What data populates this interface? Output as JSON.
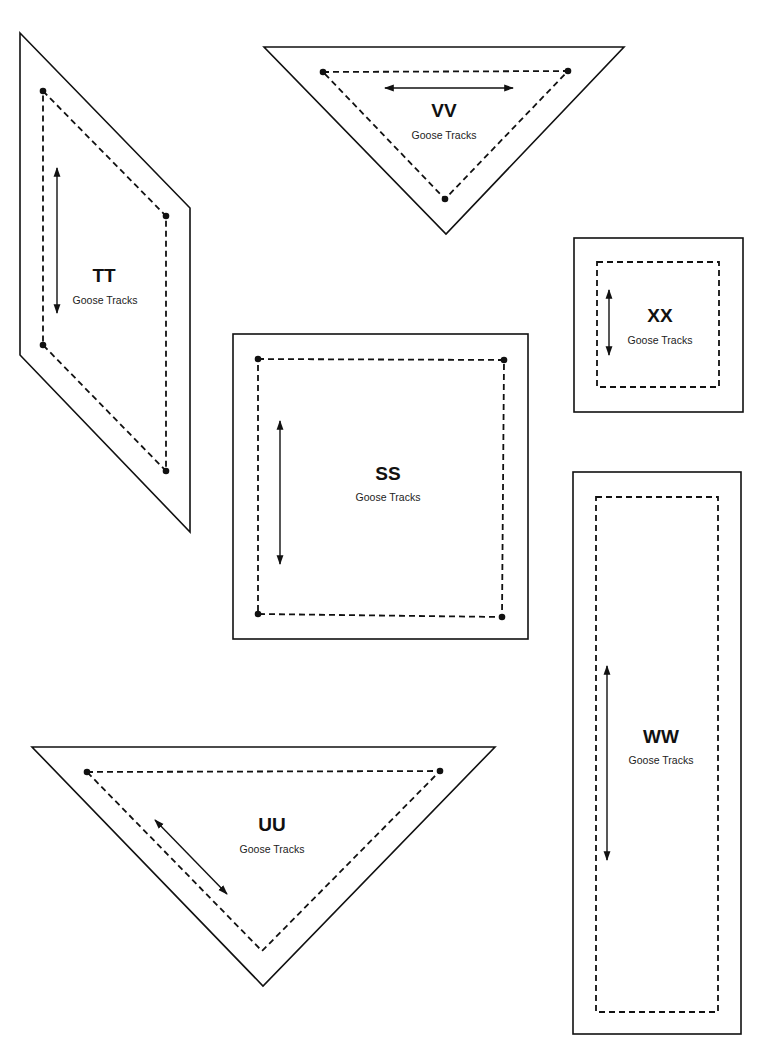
{
  "sheet": {
    "pattern_name": "Goose Tracks",
    "pieces": [
      {
        "id": "TT",
        "label": "TT",
        "subtitle": "Goose Tracks",
        "shape": "parallelogram"
      },
      {
        "id": "VV",
        "label": "VV",
        "subtitle": "Goose Tracks",
        "shape": "triangle"
      },
      {
        "id": "XX",
        "label": "XX",
        "subtitle": "Goose Tracks",
        "shape": "square"
      },
      {
        "id": "SS",
        "label": "SS",
        "subtitle": "Goose Tracks",
        "shape": "square"
      },
      {
        "id": "WW",
        "label": "WW",
        "subtitle": "Goose Tracks",
        "shape": "rectangle"
      },
      {
        "id": "UU",
        "label": "UU",
        "subtitle": "Goose Tracks",
        "shape": "triangle"
      }
    ]
  },
  "colors": {
    "line": "#111111",
    "background": "#ffffff"
  }
}
